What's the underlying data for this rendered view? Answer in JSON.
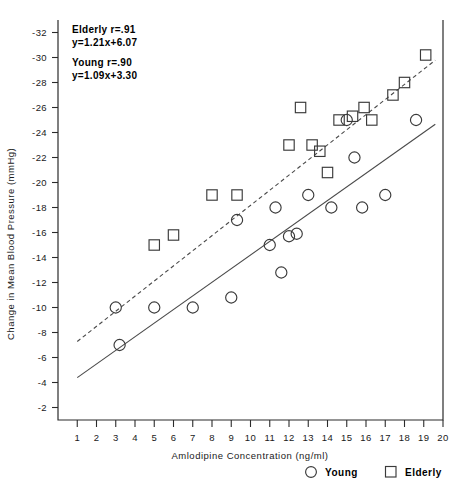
{
  "chart_data": {
    "type": "scatter",
    "title": "",
    "xlabel": "Amlodipine Concentration (ng/ml)",
    "ylabel": "Change in Mean Blood Pressure (mmHg)",
    "xlim": [
      0,
      20
    ],
    "ylim": [
      -1,
      -33
    ],
    "xticks": [
      "1",
      "2",
      "3",
      "4",
      "5",
      "6",
      "7",
      "8",
      "9",
      "10",
      "11",
      "12",
      "13",
      "14",
      "15",
      "16",
      "17",
      "18",
      "19",
      "20"
    ],
    "yticks": [
      "-2",
      "-4",
      "-6",
      "-8",
      "-10",
      "-12",
      "-14",
      "-16",
      "-18",
      "-20",
      "-22",
      "-24",
      "-26",
      "-28",
      "-30",
      "-32"
    ],
    "grid": false,
    "legend_position": "bottom-right",
    "series": [
      {
        "name": "Young",
        "marker": "circle",
        "points": [
          [
            3.0,
            -10.0
          ],
          [
            3.2,
            -7.0
          ],
          [
            5.0,
            -10.0
          ],
          [
            7.0,
            -10.0
          ],
          [
            9.0,
            -10.8
          ],
          [
            9.3,
            -17.0
          ],
          [
            11.0,
            -15.0
          ],
          [
            11.3,
            -18.0
          ],
          [
            11.6,
            -12.8
          ],
          [
            12.0,
            -15.7
          ],
          [
            12.4,
            -15.9
          ],
          [
            13.0,
            -19.0
          ],
          [
            14.2,
            -18.0
          ],
          [
            15.0,
            -25.0
          ],
          [
            15.4,
            -22.0
          ],
          [
            15.8,
            -18.0
          ],
          [
            17.0,
            -19.0
          ],
          [
            18.6,
            -25.0
          ]
        ],
        "fit": {
          "equation": "y=1.09x+3.30",
          "r": ".90",
          "slope": 1.09,
          "intercept": 3.3,
          "style": "solid"
        }
      },
      {
        "name": "Elderly",
        "marker": "square",
        "points": [
          [
            5.0,
            -15.0
          ],
          [
            6.0,
            -15.8
          ],
          [
            8.0,
            -19.0
          ],
          [
            9.3,
            -19.0
          ],
          [
            12.0,
            -23.0
          ],
          [
            12.6,
            -26.0
          ],
          [
            13.2,
            -23.0
          ],
          [
            13.6,
            -22.5
          ],
          [
            14.0,
            -20.8
          ],
          [
            14.6,
            -25.0
          ],
          [
            15.3,
            -25.3
          ],
          [
            15.9,
            -26.0
          ],
          [
            16.3,
            -25.0
          ],
          [
            17.4,
            -27.0
          ],
          [
            18.0,
            -28.0
          ],
          [
            19.1,
            -30.2
          ]
        ],
        "fit": {
          "equation": "y=1.21x+6.07",
          "r": ".91",
          "slope": 1.21,
          "intercept": 6.07,
          "style": "dashed"
        }
      }
    ],
    "annotations": [
      "Elderly r=.91",
      "y=1.21x+6.07",
      "Young r=.90",
      "y=1.09x+3.30"
    ]
  },
  "legend": {
    "items": [
      {
        "label": "Young",
        "marker": "circle"
      },
      {
        "label": "Elderly",
        "marker": "square"
      }
    ]
  }
}
